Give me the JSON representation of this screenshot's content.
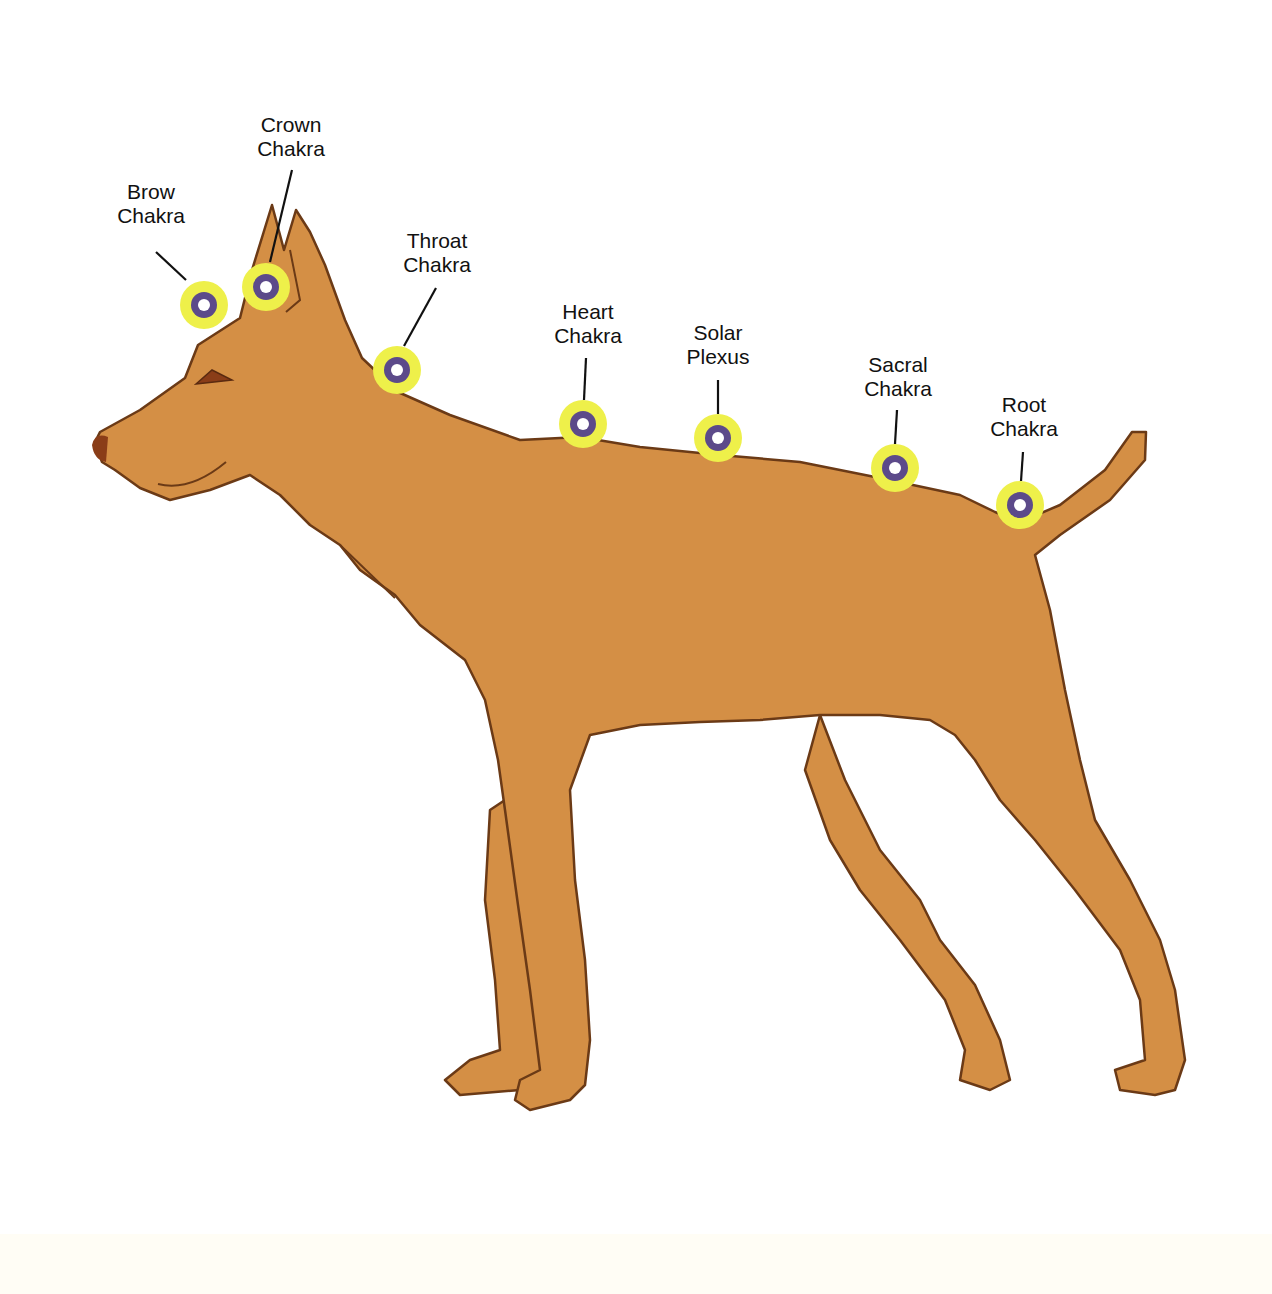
{
  "colors": {
    "background": "#ffffff",
    "dog_fill": "#d48f45",
    "dog_outline": "#6b3a16",
    "marker_outer": "#eef04a",
    "marker_ring": "#5c4a8a",
    "marker_center": "#ffffff",
    "leader_line": "#111111"
  },
  "diagram": {
    "chakras": [
      {
        "id": "brow",
        "line1": "Brow",
        "line2": "Chakra",
        "label_x": 151,
        "label_y": 180,
        "marker_x": 204,
        "marker_y": 305,
        "line_from": [
          156,
          252
        ],
        "line_to": [
          186,
          280
        ]
      },
      {
        "id": "crown",
        "line1": "Crown",
        "line2": "Chakra",
        "label_x": 291,
        "label_y": 113,
        "marker_x": 266,
        "marker_y": 287,
        "line_from": [
          292,
          170
        ],
        "line_to": [
          270,
          262
        ]
      },
      {
        "id": "throat",
        "line1": "Throat",
        "line2": "Chakra",
        "label_x": 437,
        "label_y": 229,
        "marker_x": 397,
        "marker_y": 370,
        "line_from": [
          436,
          288
        ],
        "line_to": [
          404,
          346
        ]
      },
      {
        "id": "heart",
        "line1": "Heart",
        "line2": "Chakra",
        "label_x": 588,
        "label_y": 300,
        "marker_x": 583,
        "marker_y": 424,
        "line_from": [
          586,
          358
        ],
        "line_to": [
          584,
          400
        ]
      },
      {
        "id": "solar",
        "line1": "Solar",
        "line2": "Plexus",
        "label_x": 718,
        "label_y": 321,
        "marker_x": 718,
        "marker_y": 438,
        "line_from": [
          718,
          380
        ],
        "line_to": [
          718,
          414
        ]
      },
      {
        "id": "sacral",
        "line1": "Sacral",
        "line2": "Chakra",
        "label_x": 898,
        "label_y": 353,
        "marker_x": 895,
        "marker_y": 468,
        "line_from": [
          897,
          410
        ],
        "line_to": [
          895,
          444
        ]
      },
      {
        "id": "root",
        "line1": "Root",
        "line2": "Chakra",
        "label_x": 1024,
        "label_y": 393,
        "marker_x": 1020,
        "marker_y": 505,
        "line_from": [
          1023,
          452
        ],
        "line_to": [
          1021,
          481
        ]
      }
    ]
  }
}
